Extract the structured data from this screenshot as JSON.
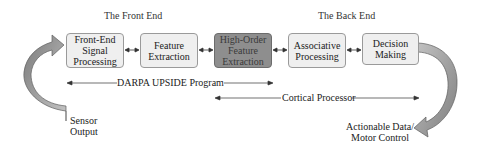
{
  "sections": {
    "front_end": "The Front End",
    "back_end": "The Back End"
  },
  "blocks": [
    {
      "id": "front-end-signal-processing",
      "lines": [
        "Front-End",
        "Signal",
        "Processing"
      ],
      "highlighted": false
    },
    {
      "id": "feature-extraction",
      "lines": [
        "Feature",
        "Extraction"
      ],
      "highlighted": false
    },
    {
      "id": "high-order-feature-extraction",
      "lines": [
        "High-Order",
        "Feature",
        "Extraction"
      ],
      "highlighted": true
    },
    {
      "id": "associative-processing",
      "lines": [
        "Associative",
        "Processing"
      ],
      "highlighted": false
    },
    {
      "id": "decision-making",
      "lines": [
        "Decision",
        "Making"
      ],
      "highlighted": false
    }
  ],
  "spans": {
    "darpa": "DARPA UPSIDE Program",
    "cortical": "Cortical Processor"
  },
  "io": {
    "input_line1": "Sensor",
    "input_line2": "Output",
    "output_line1": "Actionable Data/",
    "output_line2": "Motor Control"
  },
  "colors": {
    "box_fill": "#efefef",
    "box_highlight_fill": "#8e8e8e",
    "box_border": "#9a9a9a",
    "curved_arrow_fill": "#9c9c9c",
    "line": "#333333"
  }
}
